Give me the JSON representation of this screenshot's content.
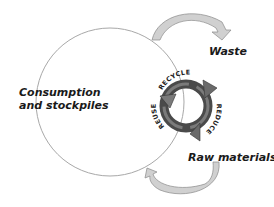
{
  "diagram": {
    "type": "cycle",
    "nodes": {
      "consumption": {
        "line1": "Consumption",
        "line2": "and stockpiles"
      },
      "waste": "Waste",
      "raw_materials": "Raw materials"
    },
    "recycle_symbol": {
      "labels": {
        "recycle": "RECYCLE",
        "reduce": "REDUCE",
        "reuse": "REUSE"
      }
    },
    "edges": [
      {
        "from": "Consumption and stockpiles",
        "to": "Waste"
      },
      {
        "from": "Raw materials",
        "to": "Consumption and stockpiles"
      }
    ],
    "colors": {
      "circle_stroke": "#a0a0a0",
      "arrow_fill": "#c8c8c8",
      "ring_dark": "#4a4a4a",
      "ring_mid": "#777777",
      "text": "#1a1a1a"
    }
  }
}
